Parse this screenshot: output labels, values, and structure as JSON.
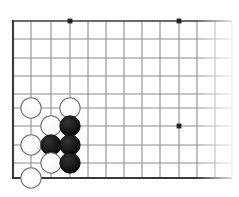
{
  "diagram": {
    "kind": "go-board-corner",
    "board_geometry": {
      "origin_x": 13,
      "origin_y": 21,
      "spacing": 18.2,
      "bottom_y": 178,
      "fade_start_x": 196,
      "fade_end_x": 232,
      "columns_visible": 12,
      "rows_visible": 9
    },
    "colors": {
      "grid_line": "#8e8e90",
      "edge_line": "#3a3a3c",
      "star_point": "#222224",
      "black_stone_fill": "#1a1a1a",
      "black_stone_edge": "#000000",
      "white_stone_fill": "#fdfdfd",
      "white_stone_edge": "#6f6f71",
      "background": "#ffffff"
    },
    "stone_radius": 10.2,
    "star_points": [
      {
        "name": "star-point-top-left",
        "x": 70,
        "y": 21
      },
      {
        "name": "star-point-top-right",
        "x": 179,
        "y": 21
      },
      {
        "name": "star-point-mid-right",
        "x": 179,
        "y": 126
      }
    ],
    "stones": [
      {
        "name": "white-stone-c8",
        "color": "white",
        "x": 31,
        "y": 108
      },
      {
        "name": "white-stone-e8",
        "color": "white",
        "x": 70,
        "y": 108
      },
      {
        "name": "white-stone-d7",
        "color": "white",
        "x": 51,
        "y": 126
      },
      {
        "name": "black-stone-e7",
        "color": "black",
        "x": 70,
        "y": 126
      },
      {
        "name": "white-stone-c6",
        "color": "white",
        "x": 31,
        "y": 145
      },
      {
        "name": "black-stone-d6",
        "color": "black",
        "x": 51,
        "y": 145
      },
      {
        "name": "black-stone-e6",
        "color": "black",
        "x": 70,
        "y": 145
      },
      {
        "name": "white-stone-d5",
        "color": "white",
        "x": 51,
        "y": 163
      },
      {
        "name": "black-stone-e5",
        "color": "black",
        "x": 70,
        "y": 163
      },
      {
        "name": "white-stone-c4",
        "color": "white",
        "x": 31,
        "y": 178
      }
    ],
    "vertical_lines_x": [
      13,
      31,
      51,
      70,
      88,
      106,
      124,
      142,
      160,
      179,
      197,
      215,
      232
    ],
    "horizontal_lines_y": [
      21,
      39,
      58,
      76,
      94,
      108,
      126,
      145,
      163,
      178
    ]
  }
}
